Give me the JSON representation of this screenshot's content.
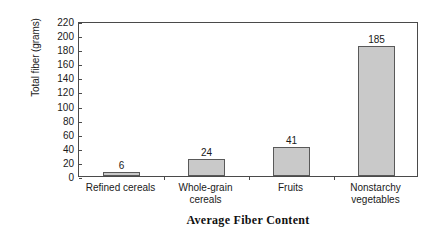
{
  "chart_data": {
    "type": "bar",
    "title": "Average Fiber Content",
    "xlabel": "Average Fiber Content",
    "ylabel": "Total fiber (grams)",
    "categories": [
      "Refined cereals",
      "Whole-grain cereals",
      "Fruits",
      "Nonstarchy vegetables"
    ],
    "category_lines": [
      [
        "Refined cereals"
      ],
      [
        "Whole-grain",
        "cereals"
      ],
      [
        "Fruits"
      ],
      [
        "Nonstarchy",
        "vegetables"
      ]
    ],
    "values": [
      6,
      24,
      41,
      185
    ],
    "value_labels": [
      "6",
      "24",
      "41",
      "185"
    ],
    "ylim": [
      0,
      220
    ],
    "ytick_step": 20,
    "yticks": [
      "220",
      "200",
      "180",
      "160",
      "140",
      "120",
      "100",
      "80",
      "60",
      "40",
      "20",
      "0"
    ],
    "grid": false,
    "legend": false,
    "colors": {
      "bar_fill": "#c9c9c9",
      "bar_border": "#595959",
      "axis": "#4a4a4a",
      "text": "#1a1a1a",
      "background": "#ffffff"
    }
  }
}
